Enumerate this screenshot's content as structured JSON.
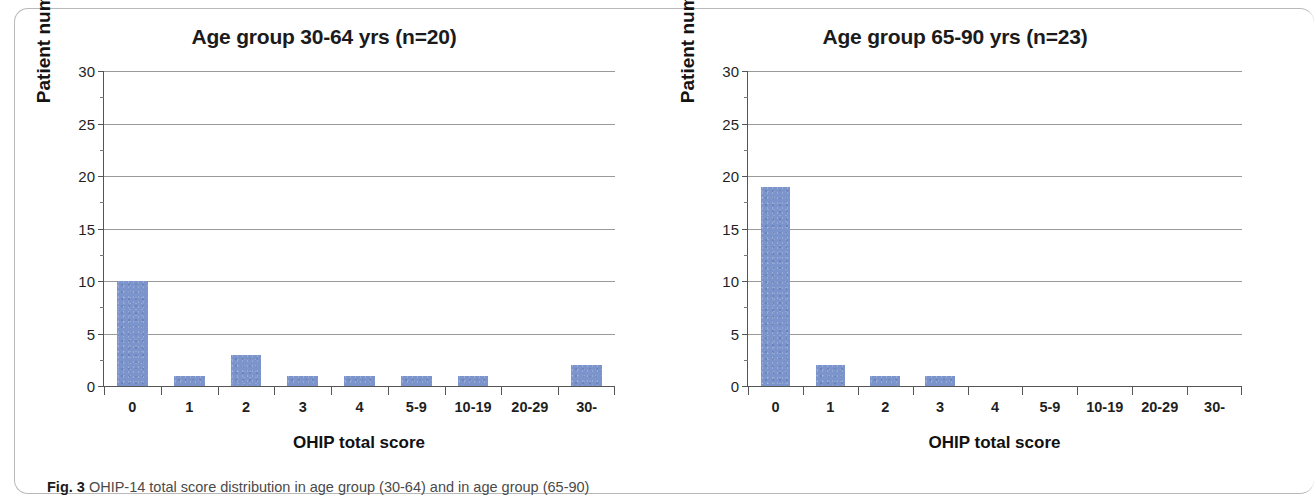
{
  "figure": {
    "caption_label": "Fig. 3",
    "caption_text": "OHIP-14 total score distribution in age group (30-64) and in age group (65-90)"
  },
  "bar_color": "#7b94cb",
  "chart_data": [
    {
      "type": "bar",
      "title": "Age group 30-64 yrs (n=20)",
      "xlabel": "OHIP total score",
      "ylabel": "Patient number",
      "categories": [
        "0",
        "1",
        "2",
        "3",
        "4",
        "5-9",
        "10-19",
        "20-29",
        "30-"
      ],
      "values": [
        10,
        1,
        3,
        1,
        1,
        1,
        1,
        0,
        2
      ],
      "ylim": [
        0,
        30
      ],
      "yticks": [
        30,
        25,
        20,
        15,
        10,
        5,
        0
      ],
      "y_minor_step": 2.5,
      "grid": "horizontal",
      "legend": "none",
      "series_color": "#7b94cb"
    },
    {
      "type": "bar",
      "title": "Age group 65-90 yrs (n=23)",
      "xlabel": "OHIP total score",
      "ylabel": "Patient number",
      "categories": [
        "0",
        "1",
        "2",
        "3",
        "4",
        "5-9",
        "10-19",
        "20-29",
        "30-"
      ],
      "values": [
        19,
        2,
        1,
        1,
        0,
        0,
        0,
        0,
        0
      ],
      "ylim": [
        0,
        30
      ],
      "yticks": [
        30,
        25,
        20,
        15,
        10,
        5,
        0
      ],
      "y_minor_step": 2.5,
      "grid": "horizontal",
      "legend": "none",
      "series_color": "#7b94cb"
    }
  ]
}
